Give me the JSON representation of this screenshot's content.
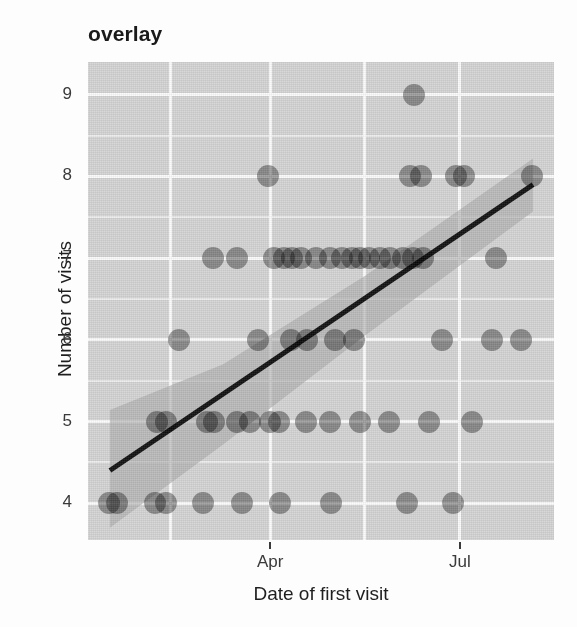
{
  "chart": {
    "type": "scatter",
    "title": "overlay",
    "xlabel": "Date of first visit",
    "ylabel": "Number of visits"
  },
  "axes": {
    "y": {
      "ticks": [
        {
          "label": "9",
          "value": 9
        },
        {
          "label": "8",
          "value": 8
        },
        {
          "label": "7",
          "value": 7
        },
        {
          "label": "6",
          "value": 6
        },
        {
          "label": "5",
          "value": 5
        },
        {
          "label": "4",
          "value": 4
        }
      ],
      "min": 3.55,
      "max": 9.4
    },
    "x": {
      "ticks": [
        {
          "label": "Apr",
          "value": 0.391
        },
        {
          "label": "Jul",
          "value": 0.798
        }
      ],
      "min": 0.0,
      "max": 1.0,
      "gridlines": [
        0.176,
        0.391,
        0.594,
        0.798
      ]
    }
  },
  "style": {
    "panel_background": "#d4d4d4",
    "major_grid": "#fbfbfb",
    "minor_grid": "#ececec",
    "point_color": "#7d7d7d",
    "line_color": "#111111",
    "ribbon_color": "#a9a9a9",
    "text_color": "#2b2b2b"
  },
  "chart_data": {
    "type": "scatter",
    "title": "overlay",
    "xlabel": "Date of first visit",
    "ylabel": "Number of visits",
    "xtick_labels": [
      "Apr",
      "Jul"
    ],
    "ytick_labels": [
      "4",
      "5",
      "6",
      "7",
      "8",
      "9"
    ],
    "ylim": [
      3.55,
      9.4
    ],
    "xlim": [
      0.0,
      1.0
    ],
    "grid": true,
    "legend": "none",
    "x_units": "normalized position across panel (0 = left edge, 1 = right edge); Apr tick = 0.391, Jul tick = 0.798",
    "points": [
      {
        "x": 0.046,
        "y": 4
      },
      {
        "x": 0.062,
        "y": 4
      },
      {
        "x": 0.143,
        "y": 4
      },
      {
        "x": 0.167,
        "y": 4
      },
      {
        "x": 0.246,
        "y": 4
      },
      {
        "x": 0.33,
        "y": 4
      },
      {
        "x": 0.412,
        "y": 4
      },
      {
        "x": 0.521,
        "y": 4
      },
      {
        "x": 0.684,
        "y": 4
      },
      {
        "x": 0.783,
        "y": 4
      },
      {
        "x": 0.148,
        "y": 5
      },
      {
        "x": 0.167,
        "y": 5
      },
      {
        "x": 0.255,
        "y": 5
      },
      {
        "x": 0.27,
        "y": 5
      },
      {
        "x": 0.32,
        "y": 5
      },
      {
        "x": 0.348,
        "y": 5
      },
      {
        "x": 0.39,
        "y": 5
      },
      {
        "x": 0.41,
        "y": 5
      },
      {
        "x": 0.468,
        "y": 5
      },
      {
        "x": 0.52,
        "y": 5
      },
      {
        "x": 0.584,
        "y": 5
      },
      {
        "x": 0.646,
        "y": 5
      },
      {
        "x": 0.731,
        "y": 5
      },
      {
        "x": 0.824,
        "y": 5
      },
      {
        "x": 0.195,
        "y": 6
      },
      {
        "x": 0.365,
        "y": 6
      },
      {
        "x": 0.436,
        "y": 6
      },
      {
        "x": 0.47,
        "y": 6
      },
      {
        "x": 0.53,
        "y": 6
      },
      {
        "x": 0.57,
        "y": 6
      },
      {
        "x": 0.76,
        "y": 6
      },
      {
        "x": 0.866,
        "y": 6
      },
      {
        "x": 0.93,
        "y": 6
      },
      {
        "x": 0.268,
        "y": 7
      },
      {
        "x": 0.32,
        "y": 7
      },
      {
        "x": 0.4,
        "y": 7
      },
      {
        "x": 0.42,
        "y": 7
      },
      {
        "x": 0.438,
        "y": 7
      },
      {
        "x": 0.458,
        "y": 7
      },
      {
        "x": 0.49,
        "y": 7
      },
      {
        "x": 0.52,
        "y": 7
      },
      {
        "x": 0.545,
        "y": 7
      },
      {
        "x": 0.566,
        "y": 7
      },
      {
        "x": 0.584,
        "y": 7
      },
      {
        "x": 0.604,
        "y": 7
      },
      {
        "x": 0.626,
        "y": 7
      },
      {
        "x": 0.648,
        "y": 7
      },
      {
        "x": 0.676,
        "y": 7
      },
      {
        "x": 0.698,
        "y": 7
      },
      {
        "x": 0.718,
        "y": 7
      },
      {
        "x": 0.876,
        "y": 7
      },
      {
        "x": 0.386,
        "y": 8
      },
      {
        "x": 0.69,
        "y": 8
      },
      {
        "x": 0.714,
        "y": 8
      },
      {
        "x": 0.79,
        "y": 8
      },
      {
        "x": 0.806,
        "y": 8
      },
      {
        "x": 0.952,
        "y": 8
      },
      {
        "x": 0.7,
        "y": 9
      }
    ],
    "fit_line": {
      "type": "linear regression",
      "points": [
        {
          "x": 0.047,
          "y": 4.4
        },
        {
          "x": 0.955,
          "y": 7.9
        }
      ]
    },
    "confidence_band": {
      "description": "shaded standard-error ribbon around the linear fit, widest at the left edge and narrowing toward the right",
      "upper": [
        {
          "x": 0.047,
          "y": 5.14
        },
        {
          "x": 0.29,
          "y": 5.7
        },
        {
          "x": 0.594,
          "y": 6.78
        },
        {
          "x": 0.955,
          "y": 8.22
        }
      ],
      "lower": [
        {
          "x": 0.047,
          "y": 3.7
        },
        {
          "x": 0.29,
          "y": 4.72
        },
        {
          "x": 0.594,
          "y": 6.05
        },
        {
          "x": 0.955,
          "y": 7.57
        }
      ]
    }
  }
}
